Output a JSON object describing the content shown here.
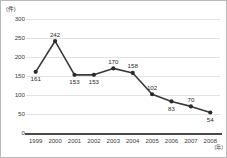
{
  "chart_data": {
    "type": "line",
    "title": "",
    "subtitle": "",
    "xlabel": "年",
    "ylabel": "件",
    "y_unit_label": "(件)",
    "x_unit_label": "(年)",
    "categories": [
      "1999",
      "2000",
      "2001",
      "2002",
      "2003",
      "2004",
      "2005",
      "2006",
      "2007",
      "2008"
    ],
    "values": [
      161,
      242,
      153,
      153,
      170,
      158,
      102,
      83,
      70,
      54
    ],
    "point_labels": [
      "161",
      "242",
      "153",
      "153",
      "170",
      "158",
      "102",
      "83",
      "70",
      "54"
    ],
    "label_positions": [
      "below",
      "above",
      "below",
      "below",
      "above",
      "above",
      "above",
      "below",
      "above",
      "below"
    ],
    "yticks": [
      0,
      50,
      100,
      150,
      200,
      250,
      300
    ],
    "ytick_labels": [
      "0",
      "50",
      "100",
      "150",
      "200",
      "250",
      "300"
    ],
    "ylim": [
      0,
      300
    ],
    "grid": true,
    "grid_color": "#e2e2e2",
    "legend": false,
    "legend_position": "none",
    "series_color": "#3a3a3a",
    "marker": "circle",
    "marker_color": "#2b2b2b",
    "axis_color": "#4a4a4a",
    "background_color": "#ffffff",
    "border_color": "#b8b8b8"
  }
}
